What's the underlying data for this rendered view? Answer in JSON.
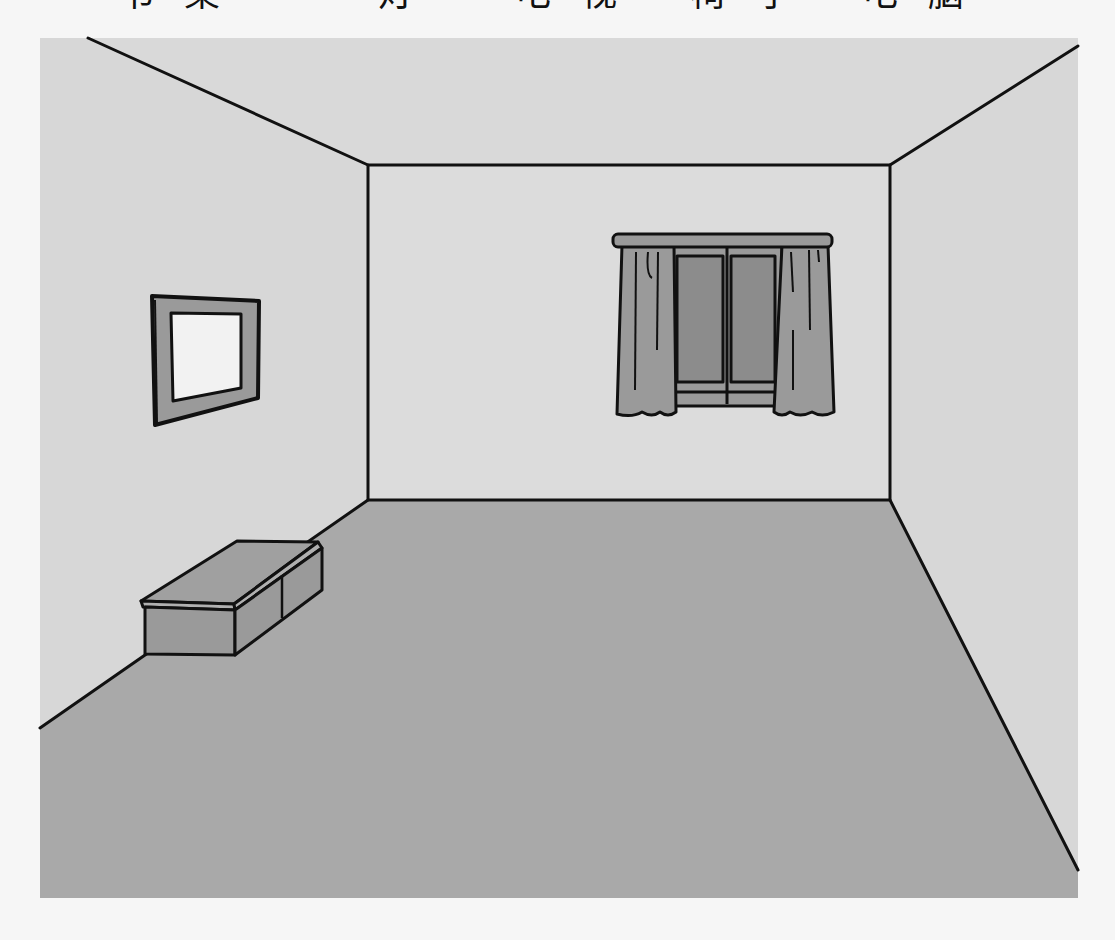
{
  "word_labels": [
    {
      "text": "书桌",
      "x": 118
    },
    {
      "text": "灯",
      "x": 378
    },
    {
      "text": "电视",
      "x": 515
    },
    {
      "text": "椅子",
      "x": 690
    },
    {
      "text": "电脑",
      "x": 862
    }
  ],
  "scene": {
    "description": "Empty room line illustration",
    "objects": [
      "picture-frame",
      "window-with-curtains",
      "low-cabinet"
    ]
  },
  "colors": {
    "page_bg": "#f6f6f6",
    "frame_bg": "#d9d9d9",
    "wall_side": "#d6d6d6",
    "wall_back": "#dcdcdc",
    "ceiling": "#d9d9d9",
    "floor": "#a9a9a9",
    "object_fill": "#9a9a9a",
    "glass": "#8c8c8c",
    "picture_inner": "#f2f2f2",
    "line": "#111111"
  }
}
